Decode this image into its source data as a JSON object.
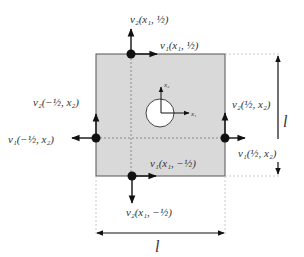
{
  "diagram": {
    "colors": {
      "fill": "#d9d9d9",
      "stroke": "#333333",
      "node": "#111111",
      "dashed": "#888888"
    },
    "labels": {
      "top_v2": "v₂(x₁, ½)",
      "top_v1": "v₁(x₁, ½)",
      "left_v2": "v₂(−½, x₂)",
      "left_v1": "v₁(−½, x₂)",
      "right_v2": "v₂(½, x₂)",
      "right_v1": "v₁(½, x₂)",
      "bottom_v1": "v₁(x₁, −½)",
      "bottom_v2": "v₂(x₁, −½)",
      "axis_x1": "x₁",
      "axis_x2": "x₂",
      "dim_width": "l",
      "dim_height": "l"
    }
  }
}
